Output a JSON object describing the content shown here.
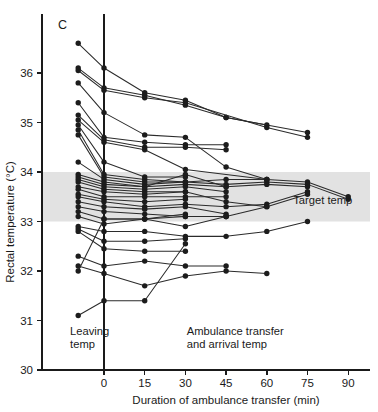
{
  "chart_data": {
    "type": "line",
    "title": "",
    "panel_label": "C",
    "xlabel": "Duration of ambulance transfer (min)",
    "ylabel": "Rectal temperature (°C)",
    "xlim": [
      -15,
      97
    ],
    "ylim": [
      30,
      36.9
    ],
    "grid": false,
    "legend_position": "none",
    "x_ticks": [
      0,
      15,
      30,
      45,
      60,
      75,
      90
    ],
    "x_tick_labels": [
      "0",
      "15",
      "30",
      "45",
      "60",
      "75",
      "90"
    ],
    "y_ticks": [
      30,
      31,
      32,
      33,
      34,
      35,
      36
    ],
    "y_tick_labels": [
      "30",
      "31",
      "32",
      "33",
      "34",
      "35",
      "36"
    ],
    "leaving_temp_x": -9.5,
    "shaded_band": {
      "label": "Target temp",
      "y_min": 33.0,
      "y_max": 34.0,
      "color": "#e2e2e2"
    },
    "annotations": [
      {
        "name": "leaving-temp-annotation",
        "lines": [
          "Leaving",
          "temp"
        ],
        "x": -12.5,
        "y": 30.7
      },
      {
        "name": "transfer-annotation",
        "lines": [
          "Ambulance transfer",
          "and arrival temp"
        ],
        "x": 30.5,
        "y": 30.7
      },
      {
        "name": "target-temp-annotation",
        "lines": [
          "Target temp"
        ],
        "x": 91.5,
        "y": 33.35
      }
    ],
    "divider_x": 0,
    "series": [
      {
        "name": "patient-01",
        "x": [
          -9.5,
          0,
          15,
          30,
          45,
          60
        ],
        "values": [
          36.6,
          36.1,
          35.6,
          35.45,
          35.1,
          34.95
        ]
      },
      {
        "name": "patient-02",
        "x": [
          -9.5,
          0,
          15,
          30,
          45,
          75
        ],
        "values": [
          36.1,
          35.7,
          35.55,
          35.35,
          35.1,
          34.8
        ]
      },
      {
        "name": "patient-03",
        "x": [
          -9.5,
          0,
          15,
          30,
          60,
          75
        ],
        "values": [
          36.05,
          35.65,
          35.5,
          35.4,
          34.9,
          34.7
        ]
      },
      {
        "name": "patient-04",
        "x": [
          -9.5,
          0,
          15,
          30,
          45,
          60
        ],
        "values": [
          35.8,
          35.2,
          34.75,
          34.7,
          34.1,
          33.85
        ]
      },
      {
        "name": "patient-05",
        "x": [
          -9.5,
          0,
          15,
          30,
          45
        ],
        "values": [
          35.4,
          34.7,
          34.6,
          34.55,
          34.55
        ]
      },
      {
        "name": "patient-06",
        "x": [
          -9.5,
          0,
          15,
          30,
          45
        ],
        "values": [
          35.15,
          34.65,
          34.5,
          34.5,
          34.45
        ]
      },
      {
        "name": "patient-07",
        "x": [
          -9.5,
          0,
          15,
          30,
          60
        ],
        "values": [
          35.05,
          34.6,
          34.45,
          34.05,
          33.85
        ]
      },
      {
        "name": "patient-08",
        "x": [
          -9.5,
          0,
          15,
          30
        ],
        "values": [
          34.95,
          34.2,
          33.9,
          33.9
        ]
      },
      {
        "name": "patient-09",
        "x": [
          -9.5,
          0,
          15,
          30
        ],
        "values": [
          34.85,
          33.95,
          33.85,
          33.8
        ]
      },
      {
        "name": "patient-10",
        "x": [
          -9.5,
          0,
          15,
          30,
          45,
          60,
          75,
          90
        ],
        "values": [
          34.75,
          33.9,
          33.8,
          33.8,
          33.85,
          33.85,
          33.8,
          33.5
        ]
      },
      {
        "name": "patient-11",
        "x": [
          -9.5,
          0,
          15,
          30,
          45,
          60,
          75,
          90
        ],
        "values": [
          34.2,
          33.85,
          33.75,
          33.8,
          33.75,
          33.8,
          33.75,
          33.45
        ]
      },
      {
        "name": "patient-12",
        "x": [
          -9.5,
          0,
          15,
          30,
          45
        ],
        "values": [
          33.95,
          33.8,
          33.7,
          33.95,
          33.7
        ]
      },
      {
        "name": "patient-13",
        "x": [
          -9.5,
          0,
          15,
          30,
          45,
          60,
          75
        ],
        "values": [
          33.9,
          33.75,
          33.7,
          33.75,
          33.7,
          33.75,
          33.7
        ]
      },
      {
        "name": "patient-14",
        "x": [
          -9.5,
          0,
          15,
          30,
          45
        ],
        "values": [
          33.85,
          33.7,
          33.65,
          33.7,
          33.6
        ]
      },
      {
        "name": "patient-15",
        "x": [
          -9.5,
          0,
          15,
          30,
          45,
          60
        ],
        "values": [
          33.8,
          33.65,
          33.6,
          33.6,
          33.4,
          33.3
        ]
      },
      {
        "name": "patient-16",
        "x": [
          -9.5,
          0,
          15,
          30
        ],
        "values": [
          33.7,
          33.6,
          33.55,
          33.6
        ]
      },
      {
        "name": "patient-17",
        "x": [
          -9.5,
          0,
          15,
          30,
          45
        ],
        "values": [
          33.65,
          33.5,
          33.5,
          33.5,
          33.5
        ]
      },
      {
        "name": "patient-18",
        "x": [
          -9.5,
          0,
          15,
          30
        ],
        "values": [
          33.55,
          33.45,
          33.4,
          33.45
        ]
      },
      {
        "name": "patient-19",
        "x": [
          -9.5,
          0,
          15,
          30,
          45,
          60,
          75
        ],
        "values": [
          33.5,
          33.4,
          33.3,
          33.35,
          33.3,
          33.35,
          33.6
        ]
      },
      {
        "name": "patient-20",
        "x": [
          -9.5,
          0,
          15,
          30,
          45
        ],
        "values": [
          33.4,
          33.3,
          33.25,
          33.3,
          33.15
        ]
      },
      {
        "name": "patient-21",
        "x": [
          -9.5,
          0,
          15,
          30,
          45,
          60,
          75
        ],
        "values": [
          33.3,
          33.2,
          33.15,
          33.1,
          33.1,
          33.3,
          33.55
        ]
      },
      {
        "name": "patient-22",
        "x": [
          -9.5,
          0,
          15,
          30
        ],
        "values": [
          33.2,
          33.05,
          33.05,
          33.15
        ]
      },
      {
        "name": "patient-23",
        "x": [
          -9.5,
          0,
          15,
          30,
          45
        ],
        "values": [
          33.1,
          32.95,
          33.05,
          32.9,
          33.1
        ]
      },
      {
        "name": "patient-24",
        "x": [
          -9.5,
          0,
          15,
          30,
          45,
          60,
          75
        ],
        "values": [
          32.9,
          32.8,
          32.8,
          32.7,
          32.7,
          32.8,
          33.0
        ]
      },
      {
        "name": "patient-25",
        "x": [
          -9.5,
          0,
          15,
          30
        ],
        "values": [
          32.85,
          32.6,
          32.6,
          32.65
        ]
      },
      {
        "name": "patient-26",
        "x": [
          -9.5,
          0,
          15,
          30
        ],
        "values": [
          32.8,
          32.45,
          32.4,
          32.4
        ]
      },
      {
        "name": "patient-27",
        "x": [
          -9.5,
          0,
          15,
          30,
          45
        ],
        "values": [
          32.3,
          32.1,
          32.2,
          32.1,
          32.1
        ]
      },
      {
        "name": "patient-28",
        "x": [
          -9.5,
          0,
          15,
          30,
          45,
          60
        ],
        "values": [
          32.1,
          31.95,
          31.7,
          31.9,
          32.0,
          31.95
        ]
      },
      {
        "name": "patient-29",
        "x": [
          -9.5,
          0,
          15,
          30,
          45
        ],
        "values": [
          32.0,
          33.05,
          33.05,
          33.1,
          33.1
        ]
      },
      {
        "name": "patient-30",
        "x": [
          -9.5,
          0,
          15,
          30
        ],
        "values": [
          31.1,
          31.4,
          31.4,
          32.55
        ]
      }
    ]
  }
}
